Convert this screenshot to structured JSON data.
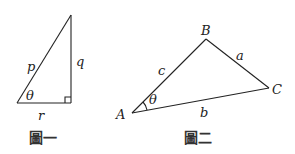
{
  "figure1": {
    "caption": "圖一",
    "hypotenuse_label": "p",
    "vertical_leg_label": "q",
    "horizontal_leg_label": "r",
    "angle_label": "θ",
    "right_angle_marker": true
  },
  "figure2": {
    "caption": "圖二",
    "vertices": {
      "A": "A",
      "B": "B",
      "C": "C"
    },
    "sides": {
      "a": "a",
      "b": "b",
      "c": "c"
    },
    "angle_label": "θ"
  }
}
